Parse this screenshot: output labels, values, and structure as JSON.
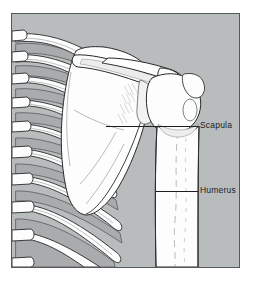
{
  "figure": {
    "view": "posterior",
    "frame": {
      "border_color": "#55585c",
      "background_color": "#b9bcbd",
      "page_background_color": "#ffffff",
      "x": 11,
      "y": 13,
      "width": 229,
      "height": 255
    },
    "palette": {
      "bone_fill": "#fdfdfd",
      "bone_shadow": "#9a9b9d",
      "bone_outline": "#27292b",
      "intercostal_fill": "#a9abad",
      "detail_line": "#6d7073",
      "label_color": "#1b1d1f",
      "leader_color": "#1b1d1f"
    },
    "labels": [
      {
        "id": "scapula",
        "text": "Scapula",
        "text_x": 200,
        "text_y": 120,
        "leader": {
          "x1": 105,
          "y1": 125,
          "x2": 197,
          "y2": 125
        }
      },
      {
        "id": "humerus",
        "text": "Humerus",
        "text_x": 200,
        "text_y": 185,
        "leader": {
          "x1": 155,
          "y1": 190,
          "x2": 197,
          "y2": 190
        }
      }
    ],
    "structures": [
      {
        "id": "scapula",
        "name": "Scapula"
      },
      {
        "id": "humerus",
        "name": "Humerus"
      },
      {
        "id": "rib-cage",
        "name": "Rib cage"
      },
      {
        "id": "vertebral-column",
        "name": "Vertebral column"
      },
      {
        "id": "acromion",
        "name": "Acromion"
      },
      {
        "id": "clavicle",
        "name": "Clavicle"
      }
    ]
  }
}
